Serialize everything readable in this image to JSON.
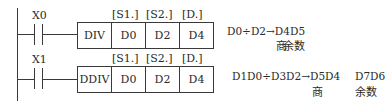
{
  "rungs": [
    {
      "contact": "X0",
      "instruction": "DIV",
      "operand_headers": [
        "[S1.]",
        "[S2.]",
        "[D.]"
      ],
      "operands": [
        "D0",
        "D2",
        "D4"
      ],
      "formula": "D0÷D2→D4",
      "remainder_reg": "D5",
      "quotient_label": "商",
      "remainder_label": "余数"
    },
    {
      "contact": "X1",
      "instruction": "DDIV",
      "operand_headers": [
        "[S1.]",
        "[S2.]",
        "[D.]"
      ],
      "operands": [
        "D0",
        "D2",
        "D4"
      ],
      "formula": "D1D0÷D3D2→D5D4",
      "remainder_reg": "D7D6",
      "quotient_label": "商",
      "remainder_label": "余数"
    }
  ]
}
